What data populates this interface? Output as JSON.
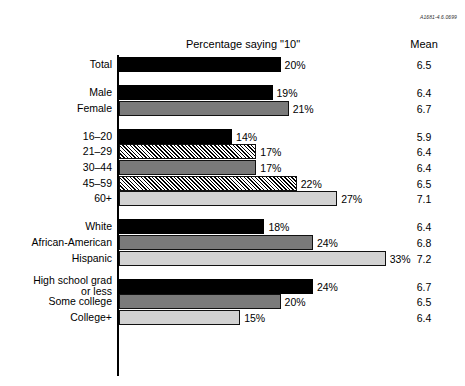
{
  "figure_id": "A1681-4.6.0699",
  "headers": {
    "percentage": "Percentage saying \"10\"",
    "mean": "Mean"
  },
  "chart_data": {
    "type": "bar",
    "orientation": "horizontal",
    "title": "Percentage saying \"10\"",
    "xlabel": "",
    "ylabel": "",
    "xlim": [
      0,
      35
    ],
    "grid": false,
    "legend": "none",
    "value_suffix": "%",
    "extra_column": "Mean",
    "categories": [
      "Total",
      "Male",
      "Female",
      "16–20",
      "21–29",
      "30–44",
      "45–59",
      "60+",
      "White",
      "African-American",
      "Hispanic",
      "High school grad\nor less",
      "Some college",
      "College+"
    ],
    "values": [
      20,
      19,
      21,
      14,
      17,
      17,
      22,
      27,
      18,
      24,
      33,
      24,
      20,
      15
    ],
    "value_labels": [
      "20%",
      "19%",
      "21%",
      "14%",
      "17%",
      "17%",
      "22%",
      "27%",
      "18%",
      "24%",
      "33%",
      "24%",
      "20%",
      "15%"
    ],
    "means": [
      6.5,
      6.4,
      6.7,
      5.9,
      6.4,
      6.4,
      6.5,
      7.1,
      6.4,
      6.8,
      7.2,
      6.7,
      6.5,
      6.4
    ],
    "mean_labels": [
      "6.5",
      "6.4",
      "6.7",
      "5.9",
      "6.4",
      "6.4",
      "6.5",
      "7.1",
      "6.4",
      "6.8",
      "7.2",
      "6.7",
      "6.5",
      "6.4"
    ],
    "fills": [
      "black",
      "black",
      "darkgray",
      "black",
      "hatch",
      "darkgray",
      "hatch",
      "lightgray",
      "black",
      "darkgray",
      "lightgray",
      "black",
      "darkgray",
      "lightgray"
    ],
    "groups": [
      {
        "name": "Total",
        "rows": [
          0
        ]
      },
      {
        "name": "Gender",
        "rows": [
          1,
          2
        ]
      },
      {
        "name": "Age",
        "rows": [
          3,
          4,
          5,
          6,
          7
        ]
      },
      {
        "name": "Race",
        "rows": [
          8,
          9,
          10
        ]
      },
      {
        "name": "Education",
        "rows": [
          11,
          12,
          13
        ]
      }
    ]
  },
  "rows": [
    {
      "label": "Total",
      "value_label": "20%",
      "mean_label": "6.5"
    },
    {
      "label": "Male",
      "value_label": "19%",
      "mean_label": "6.4"
    },
    {
      "label": "Female",
      "value_label": "21%",
      "mean_label": "6.7"
    },
    {
      "label": "16–20",
      "value_label": "14%",
      "mean_label": "5.9"
    },
    {
      "label": "21–29",
      "value_label": "17%",
      "mean_label": "6.4"
    },
    {
      "label": "30–44",
      "value_label": "17%",
      "mean_label": "6.4"
    },
    {
      "label": "45–59",
      "value_label": "22%",
      "mean_label": "6.5"
    },
    {
      "label": "60+",
      "value_label": "27%",
      "mean_label": "7.1"
    },
    {
      "label": "White",
      "value_label": "18%",
      "mean_label": "6.4"
    },
    {
      "label": "African-American",
      "value_label": "24%",
      "mean_label": "6.8"
    },
    {
      "label": "Hispanic",
      "value_label": "33%",
      "mean_label": "7.2"
    },
    {
      "label": "High school grad\nor less",
      "value_label": "24%",
      "mean_label": "6.7"
    },
    {
      "label": "Some college",
      "value_label": "20%",
      "mean_label": "6.5"
    },
    {
      "label": "College+",
      "value_label": "15%",
      "mean_label": "6.4"
    }
  ]
}
